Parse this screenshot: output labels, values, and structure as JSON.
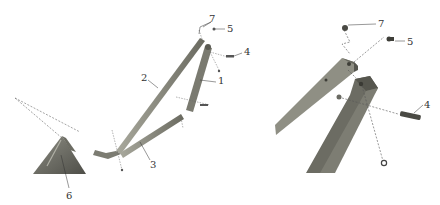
{
  "diagram": {
    "type": "exploded-assembly",
    "views": [
      "overview",
      "detail"
    ],
    "callouts": {
      "overview": [
        {
          "label": "1",
          "x": 218,
          "y": 84
        },
        {
          "label": "2",
          "x": 141,
          "y": 81
        },
        {
          "label": "3",
          "x": 150,
          "y": 168
        },
        {
          "label": "4",
          "x": 244,
          "y": 55
        },
        {
          "label": "5",
          "x": 227,
          "y": 32
        },
        {
          "label": "6",
          "x": 69,
          "y": 197
        },
        {
          "label": "7",
          "x": 211,
          "y": 23
        }
      ],
      "detail": [
        {
          "label": "7",
          "x": 378,
          "y": 27
        },
        {
          "label": "5",
          "x": 407,
          "y": 45
        },
        {
          "label": "4",
          "x": 425,
          "y": 108
        }
      ]
    },
    "colors": {
      "metal_light": "#9a9a8e",
      "metal_dark": "#5a5a52",
      "line": "#555555"
    }
  }
}
